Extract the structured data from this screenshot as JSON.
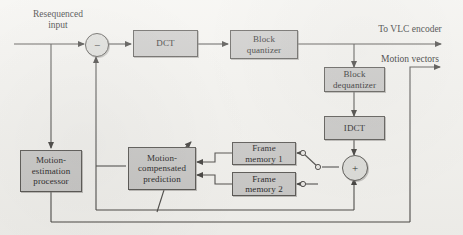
{
  "diagram": {
    "background_color": "#f4f3ef",
    "block_fill": "#c9c8c6",
    "block_stroke": "#55534f",
    "wire_color": "#4a4845"
  },
  "labels": {
    "input": "Resequenced\ninput",
    "vlc_output": "To VLC encoder",
    "motion_vectors": "Motion vectors"
  },
  "blocks": {
    "dct": "DCT",
    "block_quantizer": "Block\nquantizer",
    "block_dequantizer": "Block\ndequantizer",
    "idct": "IDCT",
    "frame_memory_1": "Frame\nmemory 1",
    "frame_memory_2": "Frame\nmemory 2",
    "motion_compensated_prediction": "Motion-\ncompensated\nprediction",
    "motion_estimation_processor": "Motion-\nestimation\nprocessor"
  },
  "nodes": {
    "subtractor": "−",
    "adder": "+"
  },
  "switch": {
    "name": "frame-memory-selector",
    "poles": 2
  }
}
